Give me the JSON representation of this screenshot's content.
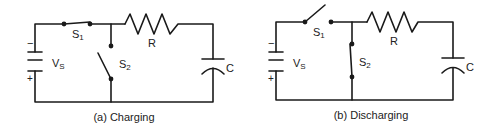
{
  "diagrams": [
    {
      "id": "a",
      "caption": "(a) Charging",
      "source_label": "V",
      "source_sub": "S",
      "switch1_label": "S",
      "switch1_sub": "1",
      "switch2_label": "S",
      "switch2_sub": "2",
      "resistor_label": "R",
      "capacitor_label": "C",
      "minus": "−",
      "plus": "+",
      "switch1_state": "closed",
      "switch2_state": "open"
    },
    {
      "id": "b",
      "caption": "(b) Discharging",
      "source_label": "V",
      "source_sub": "S",
      "switch1_label": "S",
      "switch1_sub": "1",
      "switch2_label": "S",
      "switch2_sub": "2",
      "resistor_label": "R",
      "capacitor_label": "C",
      "minus": "−",
      "plus": "+",
      "switch1_state": "open",
      "switch2_state": "closed"
    }
  ]
}
